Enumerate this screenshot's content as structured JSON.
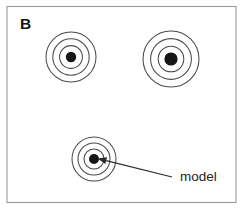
{
  "figure": {
    "panel_label": "B",
    "width": 245,
    "height": 212,
    "background_color": "#ffffff",
    "frame": {
      "x": 7,
      "y": 6.5,
      "width": 229,
      "height": 196,
      "stroke_color": "#9a9a9a",
      "fill_color": "#ffffff"
    }
  },
  "chart_data": {
    "type": "scatter",
    "title": "B",
    "xlabel": "",
    "ylabel": "",
    "ring_color": "#4a4a4a",
    "dot_color": "#161616",
    "targets": [
      {
        "name": "target-top-left",
        "cx": 71,
        "cy": 57,
        "ring_count": 3,
        "ring_radii": [
          25,
          18.2,
          11.4
        ],
        "dot_radius": 5.2
      },
      {
        "name": "target-top-right",
        "cx": 171,
        "cy": 59,
        "ring_count": 3,
        "ring_radii": [
          28,
          20.4,
          12.8
        ],
        "dot_radius": 6.6
      },
      {
        "name": "target-bottom-center",
        "cx": 94,
        "cy": 159,
        "ring_count": 3,
        "ring_radii": [
          22,
          16,
          10
        ],
        "dot_radius": 5.0
      }
    ],
    "annotations": [
      {
        "name": "model-callout",
        "text": "model",
        "text_x": 180,
        "text_y": 181,
        "arrow_from_x": 172,
        "arrow_from_y": 177,
        "arrow_to_x": 97.5,
        "arrow_to_y": 158.5,
        "target": "target-bottom-center"
      }
    ],
    "axis_visible": false,
    "grid": false,
    "legend": "none"
  }
}
